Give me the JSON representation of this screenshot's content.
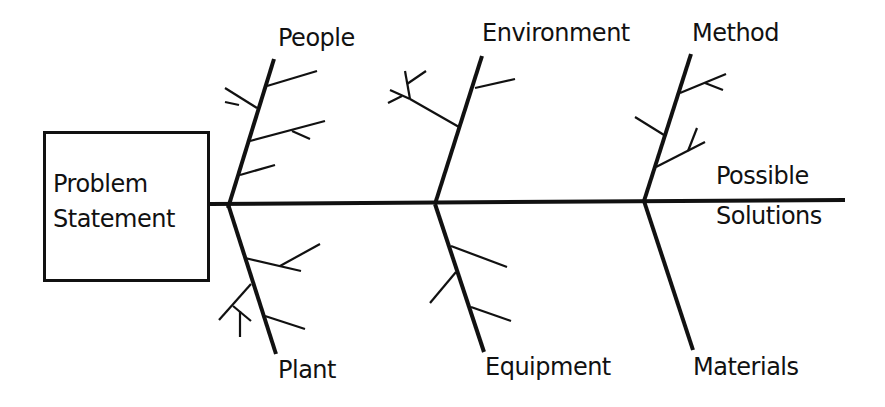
{
  "diagram": {
    "type": "fishbone",
    "problem": {
      "line1": "Problem",
      "line2": "Statement"
    },
    "head": {
      "line1": "Possible",
      "line2": "Solutions"
    },
    "categories": {
      "people": "People",
      "environment": "Environment",
      "method": "Method",
      "plant": "Plant",
      "equipment": "Equipment",
      "materials": "Materials"
    },
    "colors": {
      "line": "#111111",
      "background": "#ffffff"
    }
  }
}
